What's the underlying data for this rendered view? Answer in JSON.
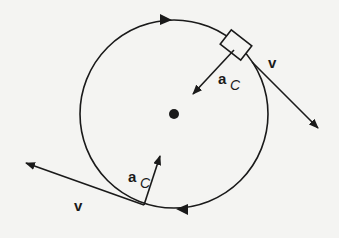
{
  "diagram": {
    "type": "uniform-circular-motion",
    "colors": {
      "ink": "#1a1a1a",
      "background": "#f4f4f2"
    },
    "labels": {
      "velocity_top": "v",
      "velocity_bottom": "v",
      "accel_top_main": "a",
      "accel_top_sub": "C",
      "accel_bottom_main": "a",
      "accel_bottom_sub": "C"
    },
    "circle": {
      "cx": 174,
      "cy": 114,
      "r": 94
    },
    "direction": "clockwise"
  }
}
